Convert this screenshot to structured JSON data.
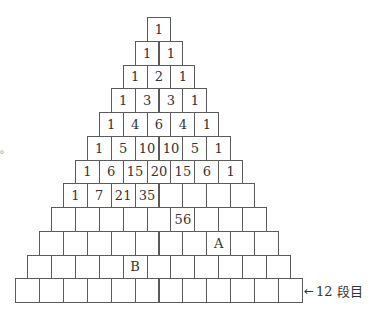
{
  "diagram": {
    "rows": 12,
    "cells": [
      [
        "1"
      ],
      [
        "1",
        "1"
      ],
      [
        "1",
        "2",
        "1"
      ],
      [
        "1",
        "3",
        "3",
        "1"
      ],
      [
        "1",
        "4",
        "6",
        "4",
        "1"
      ],
      [
        "1",
        "5",
        "10",
        "10",
        "5",
        "1"
      ],
      [
        "1",
        "6",
        "15",
        "20",
        "15",
        "6",
        "1"
      ],
      [
        "1",
        "7",
        "21",
        "35",
        "",
        "",
        "",
        ""
      ],
      [
        "",
        "",
        "",
        "",
        "",
        "56",
        "",
        "",
        ""
      ],
      [
        "",
        "",
        "",
        "",
        "",
        "",
        "",
        "A",
        "",
        ""
      ],
      [
        "",
        "",
        "",
        "",
        "B",
        "",
        "",
        "",
        "",
        "",
        ""
      ],
      [
        "",
        "",
        "",
        "",
        "",
        "",
        "",
        "",
        "",
        "",
        "",
        ""
      ]
    ],
    "row_label": {
      "arrow": "←",
      "text": "12 段目"
    },
    "side_mark": "。"
  },
  "colors": {
    "line": "#5a5a5a",
    "text": "#333333",
    "background": "#ffffff"
  }
}
